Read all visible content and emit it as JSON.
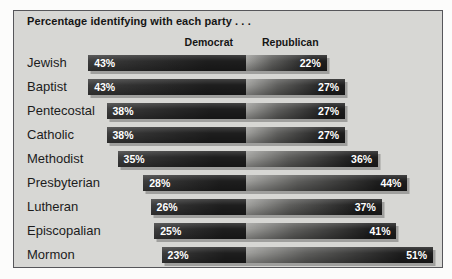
{
  "chart_data": {
    "type": "bar",
    "variant": "diverging-horizontal",
    "title": "Percentage identifying with each party . . .",
    "categories": [
      "Jewish",
      "Baptist",
      "Pentecostal",
      "Catholic",
      "Methodist",
      "Presbyterian",
      "Lutheran",
      "Episcopalian",
      "Mormon"
    ],
    "series": [
      {
        "name": "Democrat",
        "values": [
          43,
          43,
          38,
          38,
          35,
          28,
          26,
          25,
          23
        ]
      },
      {
        "name": "Republican",
        "values": [
          22,
          27,
          27,
          27,
          36,
          44,
          37,
          41,
          51
        ]
      }
    ],
    "value_suffix": "%",
    "axis_labels": "none",
    "grid": false,
    "legend_position": "top-as-column-headers",
    "value_label_color": "#ffffff"
  },
  "colors": {
    "outer_bg": "#fcfcfb",
    "panel_bg": "#d7d7d4",
    "panel_border": "#56565a",
    "bar_dark": "#1e1e1e",
    "dem_light": "#3d3d3d",
    "rep_light": "#a0a09d",
    "rep_mid": "#5f5f5d",
    "text": "#151515"
  }
}
